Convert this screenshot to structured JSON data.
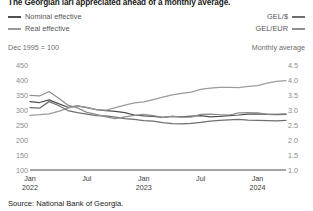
{
  "title": "The Georgian lari appreciated ahead of a monthly average.",
  "legend": {
    "left": [
      {
        "label": "Nominal effective",
        "color": "#4f4f4f",
        "icon": "line-swatch"
      },
      {
        "label": "Real effective",
        "color": "#9b9b9b",
        "icon": "line-swatch"
      }
    ],
    "right": [
      {
        "label": "GEL/$",
        "color": "#6e6e6e",
        "icon": "line-swatch"
      },
      {
        "label": "GEL/EUR",
        "color": "#8f8f8f",
        "icon": "line-swatch"
      }
    ]
  },
  "captions": {
    "left": "Dec 1995 = 100",
    "right": "Monthly average"
  },
  "source": "Source: National Bank of Georgia.",
  "chart_data": {
    "type": "line",
    "title": "The Georgian lari appreciated ahead of a monthly average.",
    "subtitle_left": "Dec 1995 = 100",
    "subtitle_right": "Monthly average",
    "xlabel": "",
    "ylabel": "Dec 1995 = 100",
    "ylabel_right": "GEL per unit of foreign currency",
    "grid": false,
    "legend_position": "top",
    "x": [
      "2022-01",
      "2022-02",
      "2022-03",
      "2022-04",
      "2022-05",
      "2022-06",
      "2022-07",
      "2022-08",
      "2022-09",
      "2022-10",
      "2022-11",
      "2022-12",
      "2023-01",
      "2023-02",
      "2023-03",
      "2023-04",
      "2023-05",
      "2023-06",
      "2023-07",
      "2023-08",
      "2023-09",
      "2023-10",
      "2023-11",
      "2023-12",
      "2024-01",
      "2024-02",
      "2024-03",
      "2024-04"
    ],
    "xticks": [
      {
        "label": "Jan",
        "year": "2022",
        "index": 0
      },
      {
        "label": "Jul",
        "year": "",
        "index": 6
      },
      {
        "label": "Jan",
        "year": "2023",
        "index": 12
      },
      {
        "label": "Jul",
        "year": "",
        "index": 18
      },
      {
        "label": "Jan",
        "year": "2024",
        "index": 24
      }
    ],
    "yticks_left": [
      450,
      400,
      350,
      300,
      250,
      200,
      150,
      100
    ],
    "ylim_left": [
      100,
      470
    ],
    "yticks_right": [
      4.5,
      4.0,
      3.5,
      3.0,
      2.5,
      2.0,
      1.5,
      1.0
    ],
    "ylim_right": [
      1.0,
      4.7
    ],
    "series": [
      {
        "name": "Nominal effective",
        "axis": "left",
        "color": "#4f4f4f",
        "unit": "index, Dec 1995 = 100",
        "values": [
          330,
          327,
          336,
          323,
          311,
          316,
          310,
          303,
          300,
          297,
          293,
          285,
          282,
          280,
          277,
          280,
          279,
          281,
          283,
          279,
          280,
          283,
          285,
          288,
          289,
          287,
          286,
          287
        ]
      },
      {
        "name": "Real effective",
        "axis": "left",
        "color": "#9b9b9b",
        "unit": "index, Dec 1995 = 100",
        "values": [
          284,
          286,
          289,
          297,
          308,
          316,
          311,
          303,
          301,
          310,
          318,
          326,
          329,
          337,
          345,
          353,
          358,
          362,
          371,
          375,
          378,
          378,
          377,
          381,
          384,
          392,
          398,
          401
        ]
      },
      {
        "name": "GEL/$",
        "axis": "right",
        "color": "#6e6e6e",
        "unit": "GEL per US dollar",
        "values": [
          3.1,
          3.08,
          3.3,
          3.17,
          3.0,
          2.93,
          2.88,
          2.83,
          2.82,
          2.78,
          2.73,
          2.7,
          2.66,
          2.64,
          2.59,
          2.56,
          2.55,
          2.57,
          2.6,
          2.64,
          2.67,
          2.69,
          2.7,
          2.68,
          2.67,
          2.66,
          2.65,
          2.67
        ]
      },
      {
        "name": "GEL/EUR",
        "axis": "right",
        "color": "#8f8f8f",
        "unit": "GEL per euro",
        "values": [
          3.51,
          3.49,
          3.64,
          3.42,
          3.18,
          3.09,
          2.94,
          2.87,
          2.79,
          2.73,
          2.79,
          2.84,
          2.87,
          2.83,
          2.77,
          2.8,
          2.78,
          2.78,
          2.87,
          2.88,
          2.86,
          2.85,
          2.92,
          2.93,
          2.92,
          2.88,
          2.88,
          2.89
        ]
      }
    ]
  }
}
